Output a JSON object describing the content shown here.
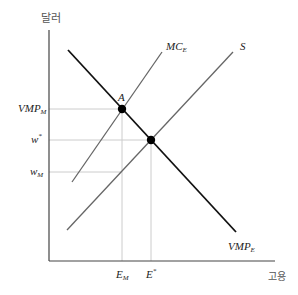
{
  "diagram": {
    "axes": {
      "y_label": "달러",
      "x_label": "고용"
    },
    "curves": {
      "vmp": {
        "label_main": "VMP",
        "label_sub": "E",
        "color": "#111111"
      },
      "mc": {
        "label_main": "MC",
        "label_sub": "E",
        "color": "#666666"
      },
      "supply": {
        "label_main": "S",
        "color": "#666666"
      }
    },
    "points": {
      "a": {
        "label": "A"
      }
    },
    "y_ticks": [
      {
        "main": "VMP",
        "sub": "M"
      },
      {
        "main": "w",
        "sup": "*"
      },
      {
        "main": "w",
        "sub": "M"
      }
    ],
    "x_ticks": [
      {
        "main": "E",
        "sub": "M"
      },
      {
        "main": "E",
        "sup": "*"
      }
    ]
  }
}
